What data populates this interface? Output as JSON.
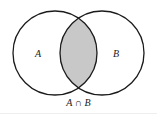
{
  "diagram": {
    "type": "venn",
    "sets": [
      {
        "label": "A",
        "cx": 55,
        "cy": 53,
        "r": 42
      },
      {
        "label": "B",
        "cx": 102,
        "cy": 53,
        "r": 42
      }
    ],
    "highlighted_region": "intersection",
    "caption": "A ∩ B",
    "colors": {
      "stroke": "#1a1a1a",
      "fill_intersection": "#c8c8c8",
      "background": "#ffffff"
    }
  }
}
